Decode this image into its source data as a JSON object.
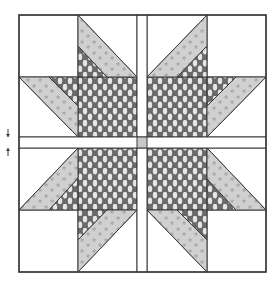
{
  "diagram": {
    "title": "Quilt block with sashing and cornerstone",
    "width": 279,
    "height": 290,
    "colors": {
      "background": "#ffffff",
      "outline": "#3a3a3a",
      "white_fabric": "#ffffff",
      "dark_fabric": "#6a6a6a",
      "dark_fabric_dots": "#e6e6e6",
      "light_fabric": "#d0d0d0",
      "light_fabric_stars": "#9a9a9a",
      "cornerstone": "#c8c8c8"
    },
    "outer_border": {
      "x": 19,
      "y": 15,
      "w": 247,
      "h": 257
    },
    "sashing": {
      "vertical": {
        "x": 137,
        "y": 15,
        "w": 10,
        "h": 257
      },
      "horizontal": {
        "x": 19,
        "y": 137,
        "w": 247,
        "h": 11
      },
      "cornerstone": {
        "x": 137,
        "y": 137,
        "w": 10,
        "h": 11
      }
    },
    "quadrants": [
      {
        "name": "top-left",
        "background_cells": [
          [
            19,
            15,
            59,
            62
          ]
        ],
        "dark_square": [
          78,
          77,
          59,
          60
        ],
        "light_bands": [
          [
            [
              78,
              15
            ],
            [
              137,
              77
            ],
            [
              107,
              77
            ],
            [
              78,
              46
            ]
          ],
          [
            [
              19,
              77
            ],
            [
              49,
              77
            ],
            [
              78,
              106
            ],
            [
              78,
              137
            ]
          ]
        ],
        "dark_triangles": [
          [
            [
              78,
              46
            ],
            [
              107,
              77
            ],
            [
              78,
              77
            ]
          ],
          [
            [
              49,
              77
            ],
            [
              78,
              77
            ],
            [
              78,
              106
            ]
          ]
        ],
        "white_triangles": [
          [
            [
              78,
              15
            ],
            [
              137,
              15
            ],
            [
              137,
              77
            ]
          ],
          [
            [
              19,
              77
            ],
            [
              78,
              137
            ],
            [
              19,
              137
            ]
          ]
        ]
      },
      {
        "name": "top-right",
        "background_cells": [
          [
            207,
            15,
            59,
            62
          ]
        ],
        "dark_square": [
          147,
          77,
          60,
          60
        ],
        "light_bands": [
          [
            [
              207,
              15
            ],
            [
              207,
              46
            ],
            [
              177,
              77
            ],
            [
              147,
              77
            ]
          ],
          [
            [
              266,
              77
            ],
            [
              236,
              77
            ],
            [
              207,
              106
            ],
            [
              207,
              137
            ]
          ]
        ],
        "dark_triangles": [
          [
            [
              207,
              46
            ],
            [
              207,
              77
            ],
            [
              177,
              77
            ]
          ],
          [
            [
              207,
              77
            ],
            [
              236,
              77
            ],
            [
              207,
              106
            ]
          ]
        ],
        "white_triangles": [
          [
            [
              147,
              15
            ],
            [
              207,
              15
            ],
            [
              147,
              77
            ]
          ],
          [
            [
              266,
              77
            ],
            [
              266,
              137
            ],
            [
              207,
              137
            ]
          ]
        ]
      },
      {
        "name": "bottom-left",
        "background_cells": [
          [
            19,
            210,
            59,
            62
          ]
        ],
        "dark_square": [
          78,
          148,
          59,
          62
        ],
        "light_bands": [
          [
            [
              78,
              148
            ],
            [
              78,
              178
            ],
            [
              49,
              210
            ],
            [
              19,
              210
            ]
          ],
          [
            [
              137,
              210
            ],
            [
              107,
              210
            ],
            [
              78,
              240
            ],
            [
              78,
              272
            ]
          ]
        ],
        "dark_triangles": [
          [
            [
              78,
              178
            ],
            [
              78,
              210
            ],
            [
              49,
              210
            ]
          ],
          [
            [
              78,
              210
            ],
            [
              107,
              210
            ],
            [
              78,
              240
            ]
          ]
        ],
        "white_triangles": [
          [
            [
              19,
              148
            ],
            [
              78,
              148
            ],
            [
              19,
              210
            ]
          ],
          [
            [
              137,
              210
            ],
            [
              137,
              272
            ],
            [
              78,
              272
            ]
          ]
        ]
      },
      {
        "name": "bottom-right",
        "background_cells": [
          [
            207,
            210,
            59,
            62
          ]
        ],
        "dark_square": [
          147,
          148,
          60,
          62
        ],
        "light_bands": [
          [
            [
              207,
              148
            ],
            [
              266,
              210
            ],
            [
              236,
              210
            ],
            [
              207,
              179
            ]
          ],
          [
            [
              147,
              210
            ],
            [
              177,
              210
            ],
            [
              207,
              240
            ],
            [
              207,
              272
            ]
          ]
        ],
        "dark_triangles": [
          [
            [
              207,
              179
            ],
            [
              236,
              210
            ],
            [
              207,
              210
            ]
          ],
          [
            [
              177,
              210
            ],
            [
              207,
              210
            ],
            [
              207,
              240
            ]
          ]
        ],
        "white_triangles": [
          [
            [
              207,
              148
            ],
            [
              266,
              148
            ],
            [
              266,
              210
            ]
          ],
          [
            [
              147,
              210
            ],
            [
              207,
              272
            ],
            [
              147,
              272
            ]
          ]
        ]
      }
    ],
    "measure_arrows": {
      "x": 8,
      "down": {
        "y1": 129,
        "y2": 137
      },
      "up": {
        "y1": 156,
        "y2": 148
      }
    }
  }
}
